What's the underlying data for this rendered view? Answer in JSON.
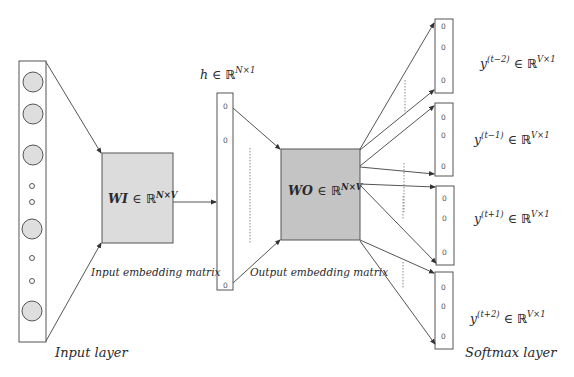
{
  "diagram": {
    "type": "skip-gram neural network architecture",
    "colors": {
      "stroke": "#555555",
      "wi_fill": "#dcdcdc",
      "wo_fill": "#c4c4c4",
      "circle_fill": "#dedede",
      "text": "#2a2a2a"
    },
    "input_layer": {
      "caption": "Input layer",
      "large_nodes": 5,
      "small_nodes": 4
    },
    "wi_matrix": {
      "symbol": "WI",
      "member": "∈",
      "space": "ℝ",
      "dims": "N×V",
      "caption": "Input embedding matrix"
    },
    "hidden_layer": {
      "symbol": "h",
      "member": "∈",
      "space": "ℝ",
      "dims": "N×1",
      "node_value": "0"
    },
    "wo_matrix": {
      "symbol": "WO",
      "member": "∈",
      "space": "ℝ",
      "dims": "N×V",
      "caption": "Output embedding matrix"
    },
    "outputs": [
      {
        "symbol": "y",
        "superscript": "(t−2)",
        "member": "∈",
        "space": "ℝ",
        "dims": "V×1",
        "node_value": "0"
      },
      {
        "symbol": "y",
        "superscript": "(t−1)",
        "member": "∈",
        "space": "ℝ",
        "dims": "V×1",
        "node_value": "0"
      },
      {
        "symbol": "y",
        "superscript": "(t+1)",
        "member": "∈",
        "space": "ℝ",
        "dims": "V×1",
        "node_value": "0"
      },
      {
        "symbol": "y",
        "superscript": "(t+2)",
        "member": "∈",
        "space": "ℝ",
        "dims": "V×1",
        "node_value": "0"
      }
    ],
    "softmax_caption": "Softmax layer"
  }
}
